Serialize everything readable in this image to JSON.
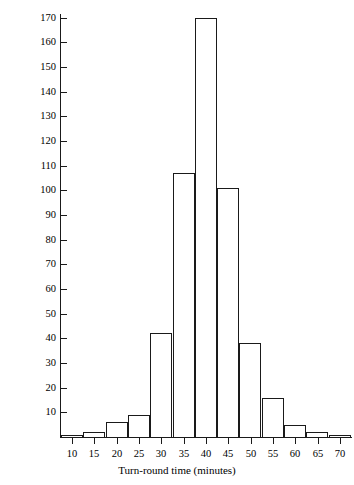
{
  "chart_data": {
    "type": "bar",
    "title": "",
    "subtitle": "",
    "xlabel": "Turn-round time (minutes)",
    "ylabel": "",
    "grid": false,
    "legend": null,
    "xlim": [
      7.5,
      72.5
    ],
    "ylim": [
      0,
      171.5
    ],
    "xtick_labels": [
      "10",
      "15",
      "20",
      "25",
      "30",
      "35",
      "40",
      "45",
      "50",
      "55",
      "60",
      "65",
      "70"
    ],
    "xtick_values": [
      10,
      15,
      20,
      25,
      30,
      35,
      40,
      45,
      50,
      55,
      60,
      65,
      70
    ],
    "ytick_labels": [
      "10",
      "20",
      "30",
      "40",
      "50",
      "60",
      "70",
      "80",
      "90",
      "100",
      "110",
      "120",
      "130",
      "140",
      "150",
      "160",
      "170"
    ],
    "ytick_values": [
      10,
      20,
      30,
      40,
      50,
      60,
      70,
      80,
      90,
      100,
      110,
      120,
      130,
      140,
      150,
      160,
      170
    ],
    "bin_width": 5,
    "categories": [
      "10",
      "15",
      "20",
      "25",
      "30",
      "35",
      "40",
      "45",
      "50",
      "55",
      "60",
      "65",
      "70"
    ],
    "bins": [
      {
        "label": "10",
        "lo": 7.5,
        "hi": 12.5,
        "value": 1
      },
      {
        "label": "15",
        "lo": 12.5,
        "hi": 17.5,
        "value": 2
      },
      {
        "label": "20",
        "lo": 17.5,
        "hi": 22.5,
        "value": 6
      },
      {
        "label": "25",
        "lo": 22.5,
        "hi": 27.5,
        "value": 9
      },
      {
        "label": "30",
        "lo": 27.5,
        "hi": 32.5,
        "value": 42
      },
      {
        "label": "35",
        "lo": 32.5,
        "hi": 37.5,
        "value": 107
      },
      {
        "label": "40",
        "lo": 37.5,
        "hi": 42.5,
        "value": 170
      },
      {
        "label": "45",
        "lo": 42.5,
        "hi": 47.5,
        "value": 101
      },
      {
        "label": "50",
        "lo": 47.5,
        "hi": 52.5,
        "value": 38
      },
      {
        "label": "55",
        "lo": 52.5,
        "hi": 57.5,
        "value": 16
      },
      {
        "label": "60",
        "lo": 57.5,
        "hi": 62.5,
        "value": 5
      },
      {
        "label": "65",
        "lo": 62.5,
        "hi": 67.5,
        "value": 2
      },
      {
        "label": "70",
        "lo": 67.5,
        "hi": 72.5,
        "value": 1
      }
    ],
    "values": [
      1,
      2,
      6,
      9,
      42,
      107,
      170,
      101,
      38,
      16,
      5,
      2,
      1
    ],
    "colors": {
      "bar_fill": "#ffffff",
      "bar_edge": "#1a1a1a",
      "axis": "#1a1a1a",
      "text": "#000000",
      "background": "#ffffff"
    }
  }
}
